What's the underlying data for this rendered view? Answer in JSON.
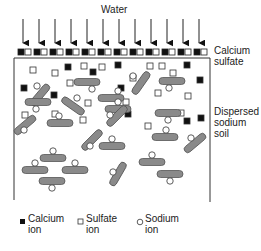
{
  "labels": {
    "water": "Water",
    "calcium_sulfate_1": "Calcium",
    "calcium_sulfate_2": "sulfate",
    "dispersed_1": "Dispersed",
    "dispersed_2": "sodium",
    "dispersed_3": "soil"
  },
  "legend": [
    {
      "icon": "calcium-ion-icon",
      "line1": "Calcium",
      "line2": "ion"
    },
    {
      "icon": "sulfate-ion-icon",
      "line1": "Sulfate",
      "line2": "ion"
    },
    {
      "icon": "sodium-ion-icon",
      "line1": "Sodium",
      "line2": "ion"
    }
  ],
  "colors": {
    "clay": "#8a8a8a",
    "clay_stroke": "#555555",
    "calcium": "#111111",
    "outline": "#333333"
  }
}
